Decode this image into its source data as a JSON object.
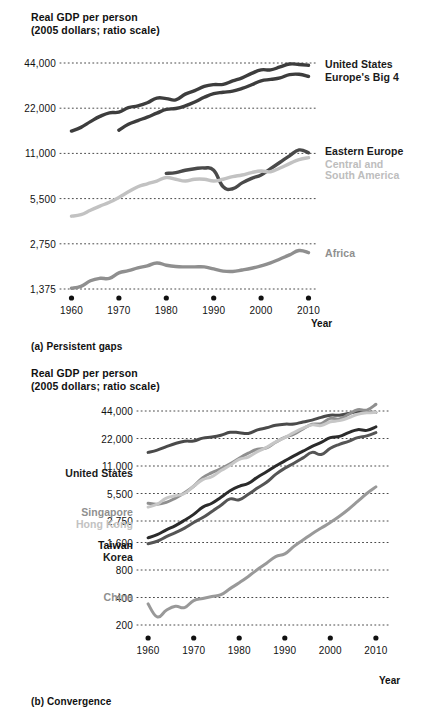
{
  "figure": {
    "panel_a_caption": "(a) Persistent gaps",
    "panel_b_caption": "(b) Convergence",
    "axis_title_line1": "Real GDP per person",
    "axis_title_line2": "(2005 dollars; ratio scale)",
    "xlabel": "Year"
  },
  "chart_data": [
    {
      "type": "line",
      "id": "panel-a",
      "title": "Real GDP per person",
      "subtitle": "(2005 dollars; ratio scale)",
      "caption": "(a) Persistent gaps",
      "xlabel": "Year",
      "ylabel": "Real GDP per person (2005 dollars; ratio scale)",
      "scale": "log",
      "grid": true,
      "legend_position": "inline-right",
      "xlim": [
        1958,
        2012
      ],
      "xticks": [
        1960,
        1970,
        1980,
        1990,
        2000,
        2010
      ],
      "xticklabels": [
        "1960",
        "1970",
        "1980",
        "1990",
        "2000",
        "2010"
      ],
      "ylim": [
        1375,
        44000
      ],
      "yticks": [
        1375,
        2750,
        5500,
        11000,
        22000,
        44000
      ],
      "yticklabels": [
        "1,375",
        "2,750",
        "5,500",
        "11,000",
        "22,000",
        "44,000"
      ],
      "series": [
        {
          "name": "United States",
          "color": "#3d3d3d",
          "label_color": "#1a1a1a",
          "x": [
            1960,
            1962,
            1964,
            1966,
            1968,
            1970,
            1972,
            1974,
            1976,
            1978,
            1980,
            1982,
            1984,
            1986,
            1988,
            1990,
            1992,
            1994,
            1996,
            1998,
            2000,
            2002,
            2004,
            2006,
            2008,
            2010
          ],
          "y": [
            15500,
            16400,
            17900,
            19400,
            20500,
            20700,
            22200,
            22800,
            23900,
            25700,
            25500,
            25000,
            27300,
            28800,
            30700,
            31600,
            31700,
            33400,
            35000,
            37500,
            39600,
            39600,
            41400,
            43300,
            43000,
            42500
          ]
        },
        {
          "name": "Europe's Big 4",
          "color": "#3d3d3d",
          "label_color": "#1a1a1a",
          "x": [
            1970,
            1972,
            1974,
            1976,
            1978,
            1980,
            1982,
            1984,
            1986,
            1988,
            1990,
            1992,
            1994,
            1996,
            1998,
            2000,
            2002,
            2004,
            2006,
            2008,
            2010
          ],
          "y": [
            15700,
            17200,
            18200,
            19200,
            20400,
            21600,
            21900,
            22800,
            24200,
            26000,
            27500,
            28100,
            28600,
            29800,
            31500,
            33500,
            34200,
            35000,
            36800,
            37000,
            35800
          ]
        },
        {
          "name": "Eastern Europe",
          "color": "#4a4a4a",
          "label_color": "#1a1a1a",
          "x": [
            1980,
            1982,
            1984,
            1986,
            1988,
            1990,
            1992,
            1994,
            1996,
            1998,
            2000,
            2002,
            2004,
            2006,
            2008,
            2010
          ],
          "y": [
            8100,
            8200,
            8500,
            8700,
            8800,
            8500,
            6600,
            6400,
            7000,
            7500,
            7900,
            8700,
            9600,
            10600,
            11600,
            11100
          ]
        },
        {
          "name": "Central and South America",
          "color": "#c2c2c2",
          "label_color": "#bdbdbd",
          "label_lines": [
            "Central and",
            "South America"
          ],
          "x": [
            1960,
            1962,
            1964,
            1966,
            1968,
            1970,
            1972,
            1974,
            1976,
            1978,
            1980,
            1982,
            1984,
            1986,
            1988,
            1990,
            1992,
            1994,
            1996,
            1998,
            2000,
            2002,
            2004,
            2006,
            2008,
            2010
          ],
          "y": [
            4200,
            4300,
            4600,
            4900,
            5200,
            5600,
            6100,
            6600,
            6900,
            7200,
            7600,
            7400,
            7200,
            7400,
            7400,
            7200,
            7400,
            7700,
            7900,
            8200,
            8400,
            8300,
            8800,
            9400,
            10000,
            10300
          ]
        },
        {
          "name": "Africa",
          "color": "#8f8f8f",
          "label_color": "#8f8f8f",
          "x": [
            1960,
            1962,
            1964,
            1966,
            1968,
            1970,
            1972,
            1974,
            1976,
            1978,
            1980,
            1982,
            1984,
            1986,
            1988,
            1990,
            1992,
            1994,
            1996,
            1998,
            2000,
            2002,
            2004,
            2006,
            2008,
            2010
          ],
          "y": [
            1390,
            1430,
            1560,
            1620,
            1620,
            1760,
            1820,
            1900,
            1960,
            2050,
            1980,
            1940,
            1930,
            1930,
            1930,
            1870,
            1810,
            1800,
            1840,
            1890,
            1960,
            2050,
            2180,
            2320,
            2480,
            2400
          ]
        }
      ]
    },
    {
      "type": "line",
      "id": "panel-b",
      "title": "Real GDP per person",
      "subtitle": "(2005 dollars; ratio scale)",
      "caption": "(b) Convergence",
      "xlabel": "Year",
      "ylabel": "Real GDP per person (2005 dollars; ratio scale)",
      "scale": "log",
      "grid": true,
      "legend_position": "inline-left",
      "xlim": [
        1958,
        2012
      ],
      "xticks": [
        1960,
        1970,
        1980,
        1990,
        2000,
        2010
      ],
      "xticklabels": [
        "1960",
        "1970",
        "1980",
        "1990",
        "2000",
        "2010"
      ],
      "ylim": [
        200,
        44000
      ],
      "yticks": [
        200,
        400,
        800,
        1600,
        2750,
        5500,
        11000,
        22000,
        44000
      ],
      "yticklabels": [
        "200",
        "400",
        "800",
        "1,600",
        "2,750",
        "5,500",
        "11,000",
        "22,000",
        "44,000"
      ],
      "series": [
        {
          "name": "United States",
          "color": "#4a4a4a",
          "label_color": "#1a1a1a",
          "x": [
            1960,
            1962,
            1964,
            1966,
            1968,
            1970,
            1972,
            1974,
            1976,
            1978,
            1980,
            1982,
            1984,
            1986,
            1988,
            1990,
            1992,
            1994,
            1996,
            1998,
            2000,
            2002,
            2004,
            2006,
            2008,
            2010
          ],
          "y": [
            15500,
            16400,
            17900,
            19400,
            20500,
            20700,
            22200,
            22800,
            23900,
            25700,
            25500,
            25000,
            27300,
            28800,
            30700,
            31600,
            31700,
            33400,
            35000,
            37500,
            39600,
            39600,
            41400,
            43300,
            43000,
            42500
          ]
        },
        {
          "name": "Singapore",
          "color": "#8f8f8f",
          "label_color": "#8f8f8f",
          "x": [
            1960,
            1962,
            1964,
            1966,
            1968,
            1970,
            1972,
            1974,
            1976,
            1978,
            1980,
            1982,
            1984,
            1986,
            1988,
            1990,
            1992,
            1994,
            1996,
            1998,
            2000,
            2002,
            2004,
            2006,
            2008,
            2010
          ],
          "y": [
            4300,
            4200,
            4400,
            4900,
            5600,
            6600,
            8200,
            9300,
            10300,
            11600,
            13400,
            15200,
            16800,
            17400,
            20000,
            22600,
            24500,
            28000,
            31500,
            32000,
            36500,
            36000,
            40500,
            45500,
            45000,
            52000
          ]
        },
        {
          "name": "Hong Kong",
          "color": "#c7c7c7",
          "label_color": "#c2c2c2",
          "x": [
            1960,
            1962,
            1964,
            1966,
            1968,
            1970,
            1972,
            1974,
            1976,
            1978,
            1980,
            1982,
            1984,
            1986,
            1988,
            1990,
            1992,
            1994,
            1996,
            1998,
            2000,
            2002,
            2004,
            2006,
            2008,
            2010
          ],
          "y": [
            3900,
            4200,
            4900,
            5200,
            5500,
            6600,
            7800,
            8400,
            9800,
            11200,
            13000,
            13800,
            15800,
            17600,
            20200,
            22500,
            25500,
            28500,
            31000,
            30500,
            33500,
            34500,
            37000,
            40500,
            42000,
            42500
          ]
        },
        {
          "name": "Taiwan",
          "color": "#2b2b2b",
          "label_color": "#111111",
          "x": [
            1960,
            1962,
            1964,
            1966,
            1968,
            1970,
            1972,
            1974,
            1976,
            1978,
            1980,
            1982,
            1984,
            1986,
            1988,
            1990,
            1992,
            1994,
            1996,
            1998,
            2000,
            2002,
            2004,
            2006,
            2008,
            2010
          ],
          "y": [
            1800,
            1950,
            2200,
            2450,
            2800,
            3250,
            3900,
            4300,
            5000,
            5900,
            6600,
            7100,
            8300,
            9500,
            11000,
            12500,
            14200,
            16000,
            18000,
            20000,
            22500,
            23200,
            25500,
            27500,
            27000,
            29500
          ]
        },
        {
          "name": "Korea",
          "color": "#555555",
          "label_color": "#1a1a1a",
          "x": [
            1960,
            1962,
            1964,
            1966,
            1968,
            1970,
            1972,
            1974,
            1976,
            1978,
            1980,
            1982,
            1984,
            1986,
            1988,
            1990,
            1992,
            1994,
            1996,
            1998,
            2000,
            2002,
            2004,
            2006,
            2008,
            2010
          ],
          "y": [
            1550,
            1650,
            1850,
            2050,
            2300,
            2650,
            3000,
            3500,
            4100,
            4800,
            4700,
            5400,
            6300,
            7300,
            8900,
            10400,
            11800,
            13500,
            15500,
            14700,
            17200,
            19000,
            20500,
            22500,
            23500,
            25500
          ]
        },
        {
          "name": "China",
          "color": "#999999",
          "label_color": "#8f8f8f",
          "x": [
            1960,
            1962,
            1964,
            1966,
            1968,
            1970,
            1972,
            1974,
            1976,
            1978,
            1980,
            1982,
            1984,
            1986,
            1988,
            1990,
            1992,
            1994,
            1996,
            1998,
            2000,
            2002,
            2004,
            2006,
            2008,
            2010
          ],
          "y": [
            340,
            245,
            290,
            320,
            310,
            370,
            390,
            410,
            430,
            500,
            580,
            680,
            810,
            950,
            1120,
            1200,
            1450,
            1700,
            2000,
            2300,
            2650,
            3100,
            3700,
            4500,
            5500,
            6500
          ]
        }
      ]
    }
  ]
}
